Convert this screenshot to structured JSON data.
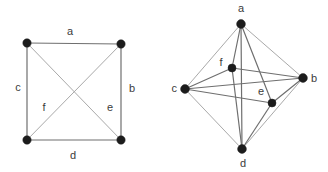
{
  "figure": {
    "title": "",
    "background_color": "#ffffff",
    "edge_color": "#8a8a8a",
    "vertex_color": "#1c1c1c",
    "label_color": "#3b3b3b"
  },
  "graphs": [
    {
      "id": "left-graph",
      "name": "square-with-diagonals",
      "vertex_count": 4,
      "vertices": [
        {
          "id": "tl",
          "cx": 27,
          "cy": 43,
          "r": 4.2,
          "label": ""
        },
        {
          "id": "tr",
          "cx": 121,
          "cy": 44,
          "r": 4.2,
          "label": ""
        },
        {
          "id": "bl",
          "cx": 27,
          "cy": 140,
          "r": 4.2,
          "label": ""
        },
        {
          "id": "br",
          "cx": 121,
          "cy": 140,
          "r": 4.2,
          "label": ""
        }
      ],
      "edges": [
        {
          "id": "a",
          "from": "tl",
          "to": "tr",
          "style": "solid",
          "label": "a",
          "label_x": 70,
          "label_y": 32
        },
        {
          "id": "b",
          "from": "tr",
          "to": "br",
          "style": "solid",
          "label": "b",
          "label_x": 132,
          "label_y": 89
        },
        {
          "id": "c",
          "from": "tl",
          "to": "bl",
          "style": "solid",
          "label": "c",
          "label_x": 18,
          "label_y": 88
        },
        {
          "id": "d",
          "from": "bl",
          "to": "br",
          "style": "solid",
          "label": "d",
          "label_x": 73,
          "label_y": 156
        },
        {
          "id": "e",
          "from": "tl",
          "to": "br",
          "style": "light",
          "label": "e",
          "label_x": 110,
          "label_y": 108
        },
        {
          "id": "f",
          "from": "tr",
          "to": "bl",
          "style": "light",
          "label": "f",
          "label_x": 44,
          "label_y": 108
        }
      ]
    },
    {
      "id": "right-graph",
      "name": "octahedron-projection",
      "vertex_count": 6,
      "vertices": [
        {
          "id": "a",
          "cx": 241,
          "cy": 24,
          "r": 4.4,
          "label": "a",
          "label_x": 241,
          "label_y": 9,
          "anchor": "middle"
        },
        {
          "id": "b",
          "cx": 303,
          "cy": 78,
          "r": 4.4,
          "label": "b",
          "label_x": 311,
          "label_y": 79,
          "anchor": "start"
        },
        {
          "id": "c",
          "cx": 185,
          "cy": 89,
          "r": 4.4,
          "label": "c",
          "label_x": 177,
          "label_y": 89,
          "anchor": "end"
        },
        {
          "id": "d",
          "cx": 242,
          "cy": 149,
          "r": 4.4,
          "label": "d",
          "label_x": 243,
          "label_y": 164,
          "anchor": "middle"
        },
        {
          "id": "e",
          "cx": 272,
          "cy": 103,
          "r": 4.0,
          "label": "e",
          "label_x": 261,
          "label_y": 92,
          "anchor": "middle"
        },
        {
          "id": "f",
          "cx": 232,
          "cy": 68,
          "r": 4.0,
          "label": "f",
          "label_x": 221,
          "label_y": 63,
          "anchor": "middle"
        }
      ],
      "edges": [
        {
          "id": "ab",
          "from": "a",
          "to": "b",
          "style": "light"
        },
        {
          "id": "ac",
          "from": "a",
          "to": "c",
          "style": "light"
        },
        {
          "id": "ae",
          "from": "a",
          "to": "e",
          "style": "solid"
        },
        {
          "id": "af",
          "from": "a",
          "to": "f",
          "style": "solid"
        },
        {
          "id": "ad",
          "from": "a",
          "to": "d",
          "style": "solid"
        },
        {
          "id": "bc",
          "from": "b",
          "to": "c",
          "style": "solid"
        },
        {
          "id": "bd",
          "from": "b",
          "to": "d",
          "style": "light"
        },
        {
          "id": "be",
          "from": "b",
          "to": "e",
          "style": "solid"
        },
        {
          "id": "bf",
          "from": "b",
          "to": "f",
          "style": "solid"
        },
        {
          "id": "cd",
          "from": "c",
          "to": "d",
          "style": "light"
        },
        {
          "id": "ce",
          "from": "c",
          "to": "e",
          "style": "solid"
        },
        {
          "id": "cf",
          "from": "c",
          "to": "f",
          "style": "solid"
        },
        {
          "id": "de",
          "from": "d",
          "to": "e",
          "style": "solid"
        },
        {
          "id": "df",
          "from": "d",
          "to": "f",
          "style": "solid"
        }
      ]
    }
  ]
}
